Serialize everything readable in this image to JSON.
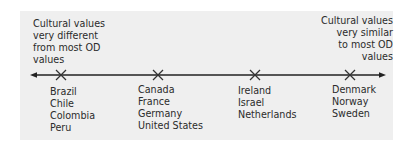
{
  "scale": {
    "left_end_label": [
      "Cultural values",
      "very different",
      "from most OD",
      "values"
    ],
    "right_end_label": [
      "Cultural values",
      "very similar",
      "to most OD",
      "values"
    ]
  },
  "groups": [
    {
      "position": 1,
      "countries": [
        "Brazil",
        "Chile",
        "Colombia",
        "Peru"
      ]
    },
    {
      "position": 2,
      "countries": [
        "Canada",
        "France",
        "Germany",
        "United States"
      ]
    },
    {
      "position": 3,
      "countries": [
        "Ireland",
        "Israel",
        "Netherlands"
      ]
    },
    {
      "position": 4,
      "countries": [
        "Denmark",
        "Norway",
        "Sweden"
      ]
    }
  ],
  "colors": {
    "panel": "#efefef",
    "line": "#222222",
    "text": "#2b2b2b"
  }
}
